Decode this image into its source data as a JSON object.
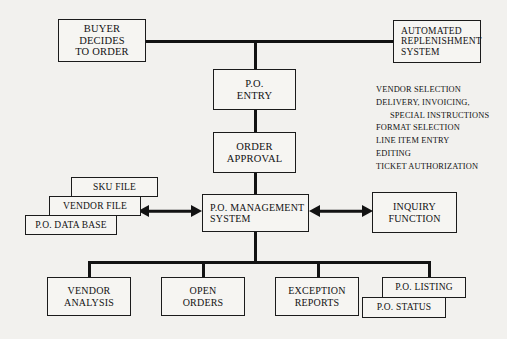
{
  "diagram": {
    "ink_color": "#121212",
    "paper_color": "#f2f1ee",
    "box_fill": "#f6f5f2"
  },
  "nodes": {
    "buyer": "BUYER\nDECIDES\nTO ORDER",
    "auto_replenishment": "AUTOMATED\nREPLENISHMENT\nSYSTEM",
    "po_entry": "P.O.\nENTRY",
    "order_approval": "ORDER\nAPPROVAL",
    "po_management": "P.O. MANAGEMENT\nSYSTEM",
    "inquiry_function": "INQUIRY\nFUNCTION",
    "sku_file": "SKU FILE",
    "vendor_file": "VENDOR FILE",
    "po_data_base": "P.O. DATA BASE",
    "vendor_analysis": "VENDOR\nANALYSIS",
    "open_orders": "OPEN\nORDERS",
    "exception_reports": "EXCEPTION\nREPORTS",
    "po_listing": "P.O. LISTING",
    "po_status": "P.O. STATUS"
  },
  "entry_functions": {
    "lines": [
      "VENDOR SELECTION",
      "DELIVERY, INVOICING,",
      "SPECIAL INSTRUCTIONS",
      "FORMAT SELECTION",
      "LINE ITEM ENTRY",
      "EDITING",
      "TICKET AUTHORIZATION"
    ]
  }
}
